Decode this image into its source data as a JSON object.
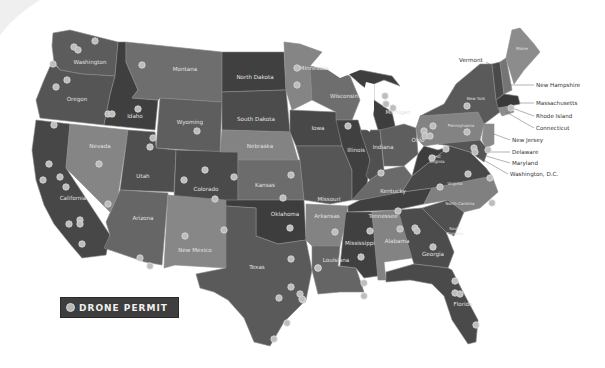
{
  "map": {
    "title": "United States Drone Permit Map",
    "colors": {
      "dark": "#474747",
      "medium": "#5c5c5c",
      "mid": "#6a6a6a",
      "light": "#828282",
      "lighter": "#8e8e8e",
      "marker": "#bdbdbd",
      "legend_bg": "#3e3e3e"
    },
    "state_labels": {
      "washington": "Washington",
      "oregon": "Oregon",
      "california": "California",
      "idaho": "Idaho",
      "nevada": "Nevada",
      "montana": "Montana",
      "wyoming": "Wyoming",
      "utah": "Utah",
      "arizona": "Arizona",
      "colorado": "Colorado",
      "new_mexico": "New Mexico",
      "north_dakota": "North Dakota",
      "south_dakota": "South Dakota",
      "nebraska": "Nebraska",
      "kansas": "Kansas",
      "oklahoma": "Oklahoma",
      "texas": "Texas",
      "minnesota": "Minnesota",
      "iowa": "Iowa",
      "missouri": "Missouri",
      "arkansas": "Arkansas",
      "louisiana": "Louisiana",
      "wisconsin": "Wisconsin",
      "illinois": "Illinois",
      "michigan": "Michigan",
      "indiana": "Indiana",
      "ohio": "Ohio",
      "kentucky": "Kentucky",
      "tennessee": "Tennessee",
      "mississippi": "Mississippi",
      "alabama": "Alabama",
      "georgia": "Georgia",
      "florida": "Florida",
      "south_carolina_1": "South",
      "south_carolina_2": "Carolina",
      "north_carolina": "North Carolina",
      "virginia": "Virginia",
      "west_virginia_1": "West",
      "west_virginia_2": "Virginia",
      "pennsylvania": "Pennsylvania",
      "new_york": "New York",
      "maine": "Maine"
    },
    "external_labels": {
      "vermont": "Vermont",
      "new_hampshire": "New Hampshire",
      "massachusetts": "Massachusetts",
      "rhode_island": "Rhode Island",
      "connecticut": "Connecticut",
      "new_jersey": "New Jersey",
      "delaware": "Delaware",
      "maryland": "Maryland",
      "washington_dc": "Washington, D.C."
    }
  },
  "legend": {
    "label": "DRONE PERMIT",
    "icon": "marker-dot-icon"
  }
}
